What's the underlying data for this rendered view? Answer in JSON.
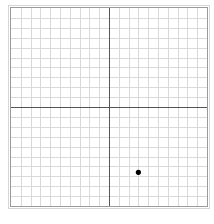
{
  "graph": {
    "x_range": [
      -10,
      10
    ],
    "y_range": [
      -10,
      10
    ],
    "grid_step": 1,
    "axis_color": "#555555",
    "grid_color": "#d9d9d9",
    "frame_color": "#9a9a9a",
    "point_color": "#000000"
  },
  "points": [
    {
      "x": 3,
      "y": -6.6
    }
  ]
}
